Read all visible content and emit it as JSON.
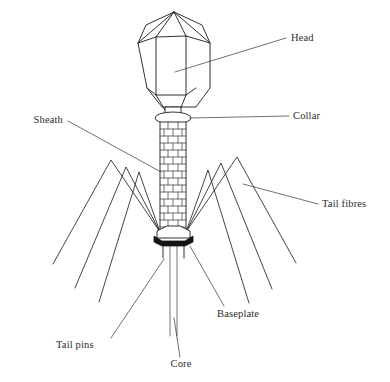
{
  "figure": {
    "background_color": "#ffffff",
    "line_color": "#1b1b1b",
    "label_color": "#2e2c2a",
    "baseplate_color": "#141414"
  },
  "labels": {
    "head": "Head",
    "collar": "Collar",
    "sheath": "Sheath",
    "tail_fibres": "Tail fibres",
    "baseplate": "Baseplate",
    "tail_pins": "Tail pins",
    "core": "Core"
  },
  "parts": [
    {
      "id": "head",
      "label": "Head",
      "label_x": 291,
      "label_y": 41,
      "anchor": "start"
    },
    {
      "id": "collar",
      "label": "Collar",
      "label_x": 293,
      "label_y": 119,
      "anchor": "start"
    },
    {
      "id": "sheath",
      "label": "Sheath",
      "label_x": 63,
      "label_y": 123,
      "anchor": "end"
    },
    {
      "id": "tail-fibres",
      "label": "Tail fibres",
      "label_x": 322,
      "label_y": 207,
      "anchor": "start"
    },
    {
      "id": "baseplate",
      "label": "Baseplate",
      "label_x": 217,
      "label_y": 317,
      "anchor": "start"
    },
    {
      "id": "tail-pins",
      "label": "Tail pins",
      "label_x": 56,
      "label_y": 348,
      "anchor": "start"
    },
    {
      "id": "core",
      "label": "Core",
      "label_x": 181,
      "label_y": 367,
      "anchor": "middle"
    }
  ]
}
